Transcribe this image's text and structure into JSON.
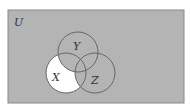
{
  "diagram": {
    "type": "venn",
    "universe_label": "U",
    "sets": [
      {
        "name": "X",
        "label": "X"
      },
      {
        "name": "Y",
        "label": "Y"
      },
      {
        "name": "Z",
        "label": "Z"
      }
    ],
    "shaded_region": "complement of X only (X minus (Y union Z) is unshaded)",
    "colors": {
      "shade": "#b4b4b4",
      "unshaded": "#ffffff",
      "stroke": "#666666"
    }
  }
}
